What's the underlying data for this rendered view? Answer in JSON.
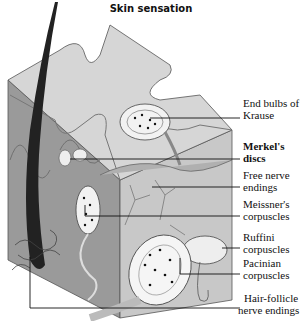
{
  "title": "Skin sensation",
  "labels": [
    {
      "line1": "End bulbs of",
      "line2": "Krause"
    },
    {
      "line1": "Merkel's",
      "line2": "discs"
    },
    {
      "line1": "Free nerve",
      "line2": "endings"
    },
    {
      "line1": "Meissner's",
      "line2": "corpuscles"
    },
    {
      "line1": "Ruffini",
      "line2": "corpuscles"
    },
    {
      "line1": "Pacinian",
      "line2": "corpuscles"
    },
    {
      "line1": "Hair-follicle",
      "line2": "nerve endings"
    }
  ]
}
